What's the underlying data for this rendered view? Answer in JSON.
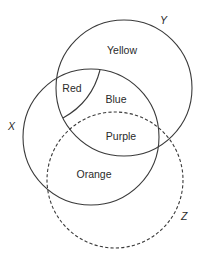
{
  "diagram": {
    "type": "venn",
    "sets": [
      {
        "id": "Y",
        "label": "Y",
        "style": "solid",
        "cx": 124,
        "cy": 88,
        "r": 68,
        "label_x": 160,
        "label_y": 24
      },
      {
        "id": "X",
        "label": "X",
        "style": "solid",
        "cx": 91,
        "cy": 137,
        "r": 68,
        "label_x": 8,
        "label_y": 130
      },
      {
        "id": "Z",
        "label": "Z",
        "style": "dashed",
        "cx": 115,
        "cy": 180,
        "r": 68,
        "label_x": 181,
        "label_y": 220
      }
    ],
    "divider": {
      "path": "M 100 70 Q 92 102 63 118"
    },
    "regions": [
      {
        "id": "yellow",
        "label": "Yellow",
        "x": 122,
        "y": 54
      },
      {
        "id": "red",
        "label": "Red",
        "x": 72,
        "y": 92
      },
      {
        "id": "blue",
        "label": "Blue",
        "x": 116,
        "y": 103
      },
      {
        "id": "purple",
        "label": "Purple",
        "x": 121,
        "y": 140
      },
      {
        "id": "orange",
        "label": "Orange",
        "x": 94,
        "y": 178
      }
    ],
    "stroke_color": "#3a3a3a",
    "text_color": "#2a2a2a",
    "background": "#ffffff"
  }
}
